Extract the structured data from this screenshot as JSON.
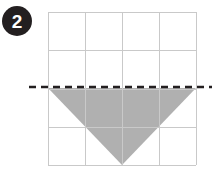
{
  "figure": {
    "badge": {
      "label": "2",
      "shape": "circle",
      "fill_color": "#231f20",
      "text_color": "#ffffff",
      "center_x": 17,
      "center_y": 21,
      "radius": 15
    },
    "grid": {
      "columns": 4,
      "rows": 4,
      "left": 48,
      "top": 12,
      "right": 196,
      "bottom": 165,
      "cell_width": 37,
      "cell_height": 38.25,
      "line_color": "#c9c9c9",
      "line_width": 1,
      "background_color": "#ffffff",
      "vertical_line_x": [
        48,
        85,
        122,
        159,
        196
      ],
      "horizontal_line_y": [
        12,
        50.25,
        88.5,
        126.75,
        165
      ]
    },
    "mirror_line": {
      "name": "line-of-reflection",
      "orientation": "horizontal",
      "y": 87,
      "x_start": 29,
      "x_end": 212,
      "color": "#231f20",
      "stroke_width": 2.4,
      "dash_pattern": "7 5"
    },
    "shape": {
      "name": "downward-triangle",
      "type": "triangle",
      "fill_color": "#b0b0b0",
      "stroke": "none",
      "points": [
        {
          "x": 48,
          "y": 88
        },
        {
          "x": 196,
          "y": 88
        },
        {
          "x": 122,
          "y": 165
        }
      ],
      "points_attr": "48,88 196,88 122,165"
    }
  }
}
